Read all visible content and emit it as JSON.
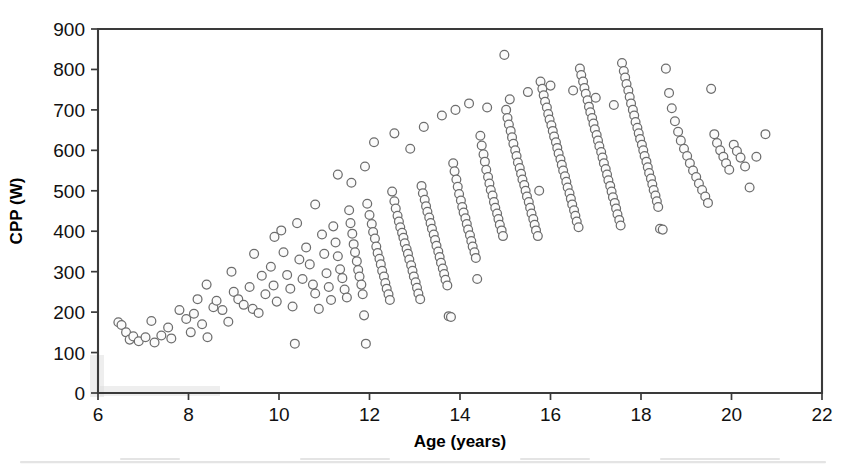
{
  "figure": {
    "background_color": "#ffffff",
    "frame_color": "#3a3a3a",
    "marker_fill": "#fbfbfb",
    "marker_stroke": "#6d6d6d"
  },
  "axes": {
    "x_title": "Age (years)",
    "y_title": "CPP (W)",
    "x_ticks": [
      "6",
      "8",
      "10",
      "12",
      "14",
      "16",
      "18",
      "20",
      "22"
    ],
    "y_ticks": [
      "0",
      "100",
      "200",
      "300",
      "400",
      "500",
      "600",
      "700",
      "800",
      "900"
    ]
  },
  "chart_data": {
    "type": "scatter",
    "title": "",
    "xlabel": "Age (years)",
    "ylabel": "CPP (W)",
    "xlim": [
      6,
      22
    ],
    "ylim": [
      0,
      900
    ],
    "xticks": [
      6,
      8,
      10,
      12,
      14,
      16,
      18,
      20,
      22
    ],
    "yticks": [
      0,
      100,
      200,
      300,
      400,
      500,
      600,
      700,
      800,
      900
    ],
    "grid": false,
    "legend": null,
    "marker": "open-circle",
    "series": [
      {
        "name": "Cycling peak power vs age",
        "points": [
          [
            6.45,
            175
          ],
          [
            6.52,
            168
          ],
          [
            6.62,
            150
          ],
          [
            6.7,
            132
          ],
          [
            6.78,
            140
          ],
          [
            6.9,
            128
          ],
          [
            7.05,
            138
          ],
          [
            7.18,
            178
          ],
          [
            7.25,
            125
          ],
          [
            7.4,
            142
          ],
          [
            7.55,
            162
          ],
          [
            7.62,
            135
          ],
          [
            7.8,
            205
          ],
          [
            7.95,
            183
          ],
          [
            8.05,
            150
          ],
          [
            8.12,
            196
          ],
          [
            8.2,
            232
          ],
          [
            8.3,
            170
          ],
          [
            8.42,
            138
          ],
          [
            8.55,
            212
          ],
          [
            8.62,
            228
          ],
          [
            8.75,
            205
          ],
          [
            8.88,
            176
          ],
          [
            9.0,
            250
          ],
          [
            9.1,
            232
          ],
          [
            9.22,
            218
          ],
          [
            9.35,
            262
          ],
          [
            9.42,
            208
          ],
          [
            9.55,
            198
          ],
          [
            9.62,
            290
          ],
          [
            9.7,
            244
          ],
          [
            9.82,
            312
          ],
          [
            9.88,
            266
          ],
          [
            9.95,
            226
          ],
          [
            10.05,
            402
          ],
          [
            10.1,
            348
          ],
          [
            10.18,
            292
          ],
          [
            10.25,
            258
          ],
          [
            10.3,
            214
          ],
          [
            10.35,
            122
          ],
          [
            10.45,
            330
          ],
          [
            10.52,
            282
          ],
          [
            10.6,
            360
          ],
          [
            10.68,
            318
          ],
          [
            10.75,
            268
          ],
          [
            10.8,
            246
          ],
          [
            10.88,
            208
          ],
          [
            10.95,
            392
          ],
          [
            11.0,
            344
          ],
          [
            11.05,
            296
          ],
          [
            11.1,
            262
          ],
          [
            11.15,
            230
          ],
          [
            11.2,
            412
          ],
          [
            11.25,
            372
          ],
          [
            11.3,
            338
          ],
          [
            11.35,
            306
          ],
          [
            11.4,
            284
          ],
          [
            11.45,
            256
          ],
          [
            11.5,
            236
          ],
          [
            11.55,
            452
          ],
          [
            11.58,
            420
          ],
          [
            11.62,
            394
          ],
          [
            11.65,
            368
          ],
          [
            11.68,
            348
          ],
          [
            11.72,
            326
          ],
          [
            11.75,
            304
          ],
          [
            11.78,
            288
          ],
          [
            11.82,
            268
          ],
          [
            11.85,
            244
          ],
          [
            11.88,
            192
          ],
          [
            11.92,
            122
          ],
          [
            11.95,
            468
          ],
          [
            12.0,
            440
          ],
          [
            12.05,
            418
          ],
          [
            12.08,
            398
          ],
          [
            12.12,
            382
          ],
          [
            12.15,
            362
          ],
          [
            12.18,
            346
          ],
          [
            12.22,
            332
          ],
          [
            12.25,
            318
          ],
          [
            12.28,
            302
          ],
          [
            12.32,
            288
          ],
          [
            12.35,
            272
          ],
          [
            12.38,
            258
          ],
          [
            12.42,
            244
          ],
          [
            12.45,
            230
          ],
          [
            12.5,
            498
          ],
          [
            12.55,
            474
          ],
          [
            12.58,
            456
          ],
          [
            12.62,
            438
          ],
          [
            12.65,
            424
          ],
          [
            12.68,
            410
          ],
          [
            12.72,
            396
          ],
          [
            12.75,
            384
          ],
          [
            12.78,
            370
          ],
          [
            12.82,
            356
          ],
          [
            12.85,
            344
          ],
          [
            12.88,
            330
          ],
          [
            12.92,
            316
          ],
          [
            12.95,
            302
          ],
          [
            12.98,
            288
          ],
          [
            13.02,
            274
          ],
          [
            13.05,
            260
          ],
          [
            13.08,
            246
          ],
          [
            13.12,
            232
          ],
          [
            13.15,
            512
          ],
          [
            13.18,
            494
          ],
          [
            13.22,
            478
          ],
          [
            13.25,
            462
          ],
          [
            13.28,
            448
          ],
          [
            13.32,
            434
          ],
          [
            13.35,
            420
          ],
          [
            13.38,
            406
          ],
          [
            13.42,
            392
          ],
          [
            13.45,
            378
          ],
          [
            13.48,
            364
          ],
          [
            13.52,
            350
          ],
          [
            13.55,
            336
          ],
          [
            13.58,
            322
          ],
          [
            13.62,
            308
          ],
          [
            13.65,
            294
          ],
          [
            13.68,
            280
          ],
          [
            13.72,
            266
          ],
          [
            13.75,
            190
          ],
          [
            13.8,
            188
          ],
          [
            13.85,
            568
          ],
          [
            13.88,
            548
          ],
          [
            13.92,
            528
          ],
          [
            13.95,
            510
          ],
          [
            13.98,
            492
          ],
          [
            14.02,
            476
          ],
          [
            14.05,
            460
          ],
          [
            14.08,
            446
          ],
          [
            14.12,
            432
          ],
          [
            14.15,
            418
          ],
          [
            14.18,
            404
          ],
          [
            14.22,
            390
          ],
          [
            14.25,
            376
          ],
          [
            14.28,
            362
          ],
          [
            14.32,
            348
          ],
          [
            14.35,
            334
          ],
          [
            14.38,
            282
          ],
          [
            14.45,
            636
          ],
          [
            14.48,
            612
          ],
          [
            14.52,
            590
          ],
          [
            14.55,
            572
          ],
          [
            14.58,
            552
          ],
          [
            14.62,
            534
          ],
          [
            14.65,
            518
          ],
          [
            14.68,
            502
          ],
          [
            14.72,
            488
          ],
          [
            14.75,
            472
          ],
          [
            14.78,
            458
          ],
          [
            14.82,
            444
          ],
          [
            14.85,
            430
          ],
          [
            14.88,
            416
          ],
          [
            14.92,
            402
          ],
          [
            14.95,
            388
          ],
          [
            14.98,
            836
          ],
          [
            15.02,
            700
          ],
          [
            15.05,
            680
          ],
          [
            15.08,
            664
          ],
          [
            15.12,
            648
          ],
          [
            15.15,
            632
          ],
          [
            15.18,
            616
          ],
          [
            15.22,
            600
          ],
          [
            15.25,
            586
          ],
          [
            15.28,
            570
          ],
          [
            15.32,
            556
          ],
          [
            15.35,
            542
          ],
          [
            15.38,
            528
          ],
          [
            15.42,
            514
          ],
          [
            15.45,
            500
          ],
          [
            15.48,
            486
          ],
          [
            15.52,
            472
          ],
          [
            15.55,
            458
          ],
          [
            15.58,
            444
          ],
          [
            15.62,
            430
          ],
          [
            15.65,
            416
          ],
          [
            15.68,
            402
          ],
          [
            15.72,
            388
          ],
          [
            15.75,
            500
          ],
          [
            15.78,
            770
          ],
          [
            15.82,
            752
          ],
          [
            15.85,
            736
          ],
          [
            15.88,
            720
          ],
          [
            15.92,
            706
          ],
          [
            15.95,
            690
          ],
          [
            15.98,
            676
          ],
          [
            16.02,
            662
          ],
          [
            16.05,
            648
          ],
          [
            16.08,
            634
          ],
          [
            16.12,
            620
          ],
          [
            16.15,
            606
          ],
          [
            16.18,
            592
          ],
          [
            16.22,
            578
          ],
          [
            16.25,
            564
          ],
          [
            16.28,
            550
          ],
          [
            16.32,
            536
          ],
          [
            16.35,
            522
          ],
          [
            16.38,
            508
          ],
          [
            16.42,
            494
          ],
          [
            16.45,
            480
          ],
          [
            16.48,
            466
          ],
          [
            16.52,
            452
          ],
          [
            16.55,
            438
          ],
          [
            16.58,
            424
          ],
          [
            16.62,
            410
          ],
          [
            16.65,
            802
          ],
          [
            16.68,
            786
          ],
          [
            16.72,
            770
          ],
          [
            16.75,
            754
          ],
          [
            16.78,
            740
          ],
          [
            16.82,
            724
          ],
          [
            16.85,
            708
          ],
          [
            16.88,
            694
          ],
          [
            16.92,
            680
          ],
          [
            16.95,
            666
          ],
          [
            16.98,
            652
          ],
          [
            17.02,
            638
          ],
          [
            17.05,
            624
          ],
          [
            17.08,
            610
          ],
          [
            17.12,
            596
          ],
          [
            17.15,
            582
          ],
          [
            17.18,
            568
          ],
          [
            17.22,
            554
          ],
          [
            17.25,
            540
          ],
          [
            17.28,
            526
          ],
          [
            17.32,
            512
          ],
          [
            17.35,
            498
          ],
          [
            17.38,
            484
          ],
          [
            17.42,
            470
          ],
          [
            17.45,
            456
          ],
          [
            17.48,
            442
          ],
          [
            17.52,
            428
          ],
          [
            17.55,
            414
          ],
          [
            17.58,
            816
          ],
          [
            17.62,
            796
          ],
          [
            17.65,
            780
          ],
          [
            17.68,
            764
          ],
          [
            17.72,
            748
          ],
          [
            17.75,
            732
          ],
          [
            17.78,
            716
          ],
          [
            17.82,
            700
          ],
          [
            17.85,
            686
          ],
          [
            17.88,
            670
          ],
          [
            17.92,
            656
          ],
          [
            17.95,
            642
          ],
          [
            17.98,
            628
          ],
          [
            18.02,
            614
          ],
          [
            18.05,
            600
          ],
          [
            18.08,
            586
          ],
          [
            18.12,
            572
          ],
          [
            18.15,
            558
          ],
          [
            18.18,
            544
          ],
          [
            18.22,
            530
          ],
          [
            18.25,
            516
          ],
          [
            18.28,
            502
          ],
          [
            18.32,
            488
          ],
          [
            18.35,
            474
          ],
          [
            18.38,
            460
          ],
          [
            18.42,
            406
          ],
          [
            18.48,
            404
          ],
          [
            18.55,
            802
          ],
          [
            18.62,
            742
          ],
          [
            18.68,
            704
          ],
          [
            18.75,
            672
          ],
          [
            18.82,
            646
          ],
          [
            18.88,
            624
          ],
          [
            18.95,
            604
          ],
          [
            19.02,
            586
          ],
          [
            19.08,
            568
          ],
          [
            19.15,
            550
          ],
          [
            19.22,
            534
          ],
          [
            19.28,
            518
          ],
          [
            19.35,
            502
          ],
          [
            19.42,
            486
          ],
          [
            19.48,
            470
          ],
          [
            19.55,
            752
          ],
          [
            19.62,
            640
          ],
          [
            19.68,
            618
          ],
          [
            19.75,
            600
          ],
          [
            19.82,
            584
          ],
          [
            19.88,
            568
          ],
          [
            19.95,
            552
          ],
          [
            20.05,
            614
          ],
          [
            20.12,
            598
          ],
          [
            20.2,
            582
          ],
          [
            20.3,
            560
          ],
          [
            20.4,
            508
          ],
          [
            20.55,
            584
          ],
          [
            20.75,
            640
          ],
          [
            12.1,
            620
          ],
          [
            12.55,
            642
          ],
          [
            12.9,
            604
          ],
          [
            13.2,
            658
          ],
          [
            13.6,
            686
          ],
          [
            13.9,
            700
          ],
          [
            14.2,
            716
          ],
          [
            14.6,
            706
          ],
          [
            15.1,
            726
          ],
          [
            15.5,
            744
          ],
          [
            16.0,
            760
          ],
          [
            16.5,
            748
          ],
          [
            17.0,
            730
          ],
          [
            17.4,
            712
          ],
          [
            11.3,
            540
          ],
          [
            11.6,
            520
          ],
          [
            11.9,
            560
          ],
          [
            10.8,
            466
          ],
          [
            10.4,
            420
          ],
          [
            9.9,
            386
          ],
          [
            9.45,
            344
          ],
          [
            8.95,
            300
          ],
          [
            8.4,
            268
          ]
        ]
      }
    ]
  }
}
